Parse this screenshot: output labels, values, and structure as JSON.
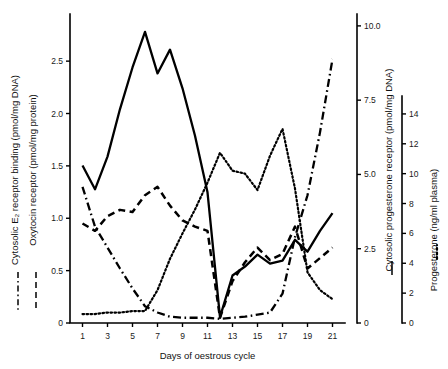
{
  "figure": {
    "xaxis_title": "Days of oestrous cycle",
    "axes": [
      {
        "id": "left-outer",
        "title": "Cytosolic E₂ receptor binding (pmol/mg DNA)",
        "legend_style": "dash-dot",
        "series_ref": "e2_receptor"
      },
      {
        "id": "left-inner",
        "title": "Oxytocin receptor (pmol/mg protein)",
        "legend_style": "dashed",
        "series_ref": "oxytocin_receptor"
      },
      {
        "id": "right-inner",
        "title": "Cytosolic progesterone receptor (pmol/mg DNA)",
        "legend_style": "solid",
        "series_ref": "progesterone_receptor"
      },
      {
        "id": "right-outer",
        "title": "Progesterone (ng/ml plasma)",
        "legend_style": "dotted",
        "series_ref": "progesterone"
      }
    ]
  },
  "chart_data": {
    "type": "line",
    "title": "",
    "xlabel": "Days of oestrous cycle",
    "ylabel": "Cytosolic E₂ receptor binding (pmol/mg DNA) / Oxytocin receptor (pmol/mg protein)",
    "grid": false,
    "legend_position": "axis-labels",
    "x": [
      1,
      2,
      3,
      4,
      5,
      6,
      7,
      8,
      9,
      10,
      11,
      12,
      13,
      14,
      15,
      16,
      17,
      18,
      19,
      20,
      21
    ],
    "xticks": [
      1,
      3,
      5,
      7,
      9,
      11,
      13,
      15,
      17,
      19,
      21
    ],
    "xlim": [
      0,
      22
    ],
    "axis_left": {
      "label": "Cytosolic E₂ receptor binding (pmol/mg DNA) / Oxytocin receptor (pmol/mg protein)",
      "ticks": [
        0,
        0.5,
        1.0,
        1.5,
        2.0,
        2.5
      ],
      "ticklabels": [
        "0",
        "0.5",
        "1.0",
        "1.5",
        "2.0",
        "2.5"
      ],
      "ylim": [
        0,
        2.95
      ]
    },
    "axis_right_inner": {
      "label": "Cytosolic progesterone receptor (pmol/mg DNA)",
      "ticks": [
        0,
        2.5,
        5.0,
        7.5,
        10.0
      ],
      "ticklabels": [
        "0",
        "2.5",
        "5.0",
        "7.5",
        "10.0"
      ],
      "ylim": [
        0,
        10.4
      ]
    },
    "axis_right_outer": {
      "label": "Progesterone (ng/ml plasma)",
      "ticks": [
        0,
        2,
        4,
        6,
        8,
        10,
        12,
        14
      ],
      "ticklabels": [
        "0",
        "2",
        "4",
        "6",
        "8",
        "10",
        "12",
        "14"
      ],
      "ylim": [
        0,
        15.2
      ]
    },
    "series": [
      {
        "name": "Cytosolic E₂ receptor binding (pmol/mg DNA)",
        "style": "dash-dot",
        "axis": "left",
        "units": "pmol/mg DNA",
        "values": [
          1.3,
          0.92,
          0.72,
          0.52,
          0.33,
          0.16,
          0.1,
          0.06,
          0.05,
          0.05,
          0.05,
          0.04,
          0.05,
          0.06,
          0.08,
          0.1,
          0.28,
          0.82,
          1.22,
          1.82,
          2.52
        ]
      },
      {
        "name": "Oxytocin receptor (pmol/mg protein)",
        "style": "dashed",
        "axis": "left",
        "units": "pmol/mg protein",
        "values": [
          0.95,
          0.88,
          1.02,
          1.08,
          1.06,
          1.22,
          1.3,
          1.12,
          0.98,
          0.92,
          0.88,
          0.05,
          0.4,
          0.58,
          0.72,
          0.6,
          0.66,
          0.92,
          0.52,
          0.62,
          0.72
        ]
      },
      {
        "name": "Cytosolic progesterone receptor (pmol/mg DNA)",
        "style": "solid",
        "axis": "right-inner",
        "units": "pmol/mg DNA",
        "values": [
          5.3,
          4.5,
          5.6,
          7.2,
          8.6,
          9.8,
          8.4,
          9.2,
          7.9,
          6.3,
          4.4,
          0.2,
          1.6,
          1.9,
          2.3,
          2.0,
          2.1,
          2.8,
          2.4,
          3.1,
          3.7
        ]
      },
      {
        "name": "Progesterone (ng/ml plasma)",
        "style": "dotted",
        "axis": "right-outer",
        "units": "ng/ml plasma",
        "values": [
          0.6,
          0.6,
          0.7,
          0.7,
          0.8,
          0.8,
          2.2,
          4.3,
          6.0,
          7.6,
          9.4,
          11.4,
          10.2,
          10.0,
          8.9,
          11.2,
          13.0,
          9.0,
          3.4,
          2.2,
          1.6
        ]
      }
    ]
  }
}
